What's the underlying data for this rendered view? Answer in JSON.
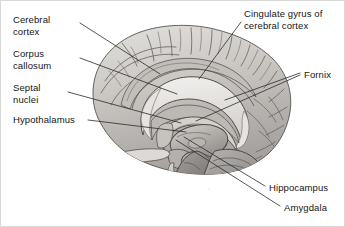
{
  "figure": {
    "width": 345,
    "height": 227,
    "background_color": "#ffffff",
    "border_color": "#d8d8d8",
    "label_color": "#161616",
    "leader_line_color": "#2b2b2b"
  },
  "labels": {
    "cerebral_cortex": "Cerebral\ncortex",
    "corpus_callosum": "Corpus\ncallosum",
    "septal_nuclei": "Septal\nnuclei",
    "hypothalamus": "Hypothalamus",
    "cingulate_gyrus": "Cingulate gyrus of\ncerebral cortex",
    "fornix": "Fornix",
    "hippocampus": "Hippocampus",
    "amygdala": "Amygdala"
  },
  "label_positions": {
    "cerebral_cortex": {
      "x": 12,
      "y": 13
    },
    "corpus_callosum": {
      "x": 12,
      "y": 47
    },
    "septal_nuclei": {
      "x": 12,
      "y": 81
    },
    "hypothalamus": {
      "x": 12,
      "y": 113
    },
    "cingulate_gyrus": {
      "x": 243,
      "y": 7
    },
    "fornix": {
      "x": 303,
      "y": 68
    },
    "hippocampus": {
      "x": 268,
      "y": 181
    },
    "amygdala": {
      "x": 283,
      "y": 201
    }
  },
  "leader_lines": [
    {
      "name": "cerebral-cortex-leader",
      "x1": 79,
      "y1": 22,
      "x2": 159,
      "y2": 73
    },
    {
      "name": "corpus-callosum-leader",
      "x1": 79,
      "y1": 57,
      "x2": 176,
      "y2": 93
    },
    {
      "name": "septal-nuclei-leader",
      "x1": 67,
      "y1": 91,
      "x2": 180,
      "y2": 122
    },
    {
      "name": "hypothalamus-leader",
      "x1": 87,
      "y1": 119,
      "x2": 185,
      "y2": 131
    },
    {
      "name": "cingulate-gyrus-leader",
      "x1": 240,
      "y1": 21,
      "x2": 198,
      "y2": 78
    },
    {
      "name": "fornix-leader-upper",
      "x1": 299,
      "y1": 72,
      "x2": 224,
      "y2": 99
    },
    {
      "name": "fornix-leader-lower",
      "x1": 299,
      "y1": 74,
      "x2": 195,
      "y2": 120
    },
    {
      "name": "hippocampus-leader",
      "x1": 264,
      "y1": 185,
      "x2": 183,
      "y2": 136
    },
    {
      "name": "amygdala-leader",
      "x1": 279,
      "y1": 205,
      "x2": 175,
      "y2": 139
    }
  ],
  "illustration": {
    "name": "brain-midsagittal-illustration",
    "description": "Grayscale halftone drawing of a human brain cut in the midsagittal plane, showing cerebral cortex gyri, corpus callosum, fornix, thalamus, hypothalamus, brainstem and cerebellum.",
    "palette": {
      "cortex_light": "#d9d7d4",
      "cortex_mid": "#bab7b3",
      "cortex_shadow": "#8e8b88",
      "deep_structure": "#a5a2a0",
      "outline": "#4a4846",
      "white_matter": "#eeecea",
      "brainstem": "#7e7b79",
      "cerebellum": "#9a9795"
    }
  }
}
